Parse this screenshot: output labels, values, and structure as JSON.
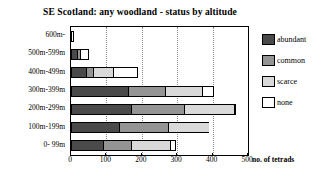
{
  "chart_data": {
    "type": "bar",
    "orientation": "horizontal",
    "stacked": true,
    "title": "SE Scotland: any woodland - status by altitude",
    "xlabel": "no. of tetrads",
    "ylabel": "",
    "xlim": [
      0,
      500
    ],
    "xticks": [
      0,
      100,
      200,
      300,
      400,
      500
    ],
    "xtick_labels": [
      "0",
      "100",
      "200",
      "300",
      "400",
      "500"
    ],
    "grid": "vertical-dotted",
    "legend_position": "right",
    "categories": [
      "0- 99m",
      "100m-199m",
      "200m-299m",
      "300m-399m",
      "400m-499m",
      "500m-599m",
      "600m-"
    ],
    "series": [
      {
        "name": "abundant",
        "color": "#4a4a4a",
        "values": [
          90,
          135,
          170,
          160,
          42,
          16,
          0
        ]
      },
      {
        "name": "common",
        "color": "#949494",
        "values": [
          80,
          140,
          150,
          105,
          20,
          10,
          0
        ]
      },
      {
        "name": "scarce",
        "color": "#d9d9d9",
        "values": [
          110,
          115,
          140,
          105,
          58,
          0,
          0
        ]
      },
      {
        "name": "none",
        "color": "#ffffff",
        "values": [
          18,
          0,
          3,
          35,
          70,
          24,
          8
        ]
      }
    ],
    "totals": [
      298,
      390,
      463,
      405,
      190,
      50,
      8
    ]
  },
  "legend": {
    "items": [
      {
        "label": "abundant",
        "swatch": "abundant"
      },
      {
        "label": "common",
        "swatch": "common"
      },
      {
        "label": "scarce",
        "swatch": "scarce"
      },
      {
        "label": "none",
        "swatch": "none"
      }
    ]
  }
}
